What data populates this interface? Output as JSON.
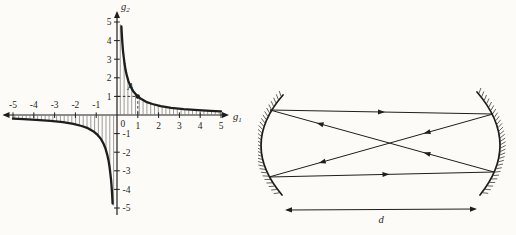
{
  "figure": {
    "background": "#fcfbf8",
    "ink": "#1e1e1e"
  },
  "chart": {
    "origin_label": "0",
    "x_axis_label": {
      "base": "g",
      "sub": "1"
    },
    "y_axis_label": {
      "base": "g",
      "sub": "2"
    }
  },
  "chart_data": {
    "type": "line",
    "title": "",
    "xlabel": "g1",
    "ylabel": "g2",
    "xlim": [
      -5.5,
      5.4
    ],
    "ylim": [
      -5.4,
      5.55
    ],
    "grid": false,
    "legend": false,
    "x_ticks": [
      -5,
      -4,
      -3,
      -2,
      -1,
      1,
      2,
      3,
      4,
      5
    ],
    "y_ticks": [
      5,
      4,
      3,
      2,
      1,
      -1,
      -2,
      -3,
      -4,
      -5
    ],
    "series": [
      {
        "name": "g2 = 1/g1 (g1 > 0)",
        "x": [
          0.21,
          0.22,
          0.24,
          0.26,
          0.29,
          0.32,
          0.36,
          0.41,
          0.47,
          0.55,
          0.65,
          0.78,
          0.95,
          1.15,
          1.4,
          1.7,
          2.1,
          2.6,
          3.2,
          3.9,
          4.5,
          5.0
        ],
        "y": [
          4.76,
          4.55,
          4.17,
          3.85,
          3.45,
          3.13,
          2.78,
          2.44,
          2.13,
          1.82,
          1.54,
          1.28,
          1.05,
          0.87,
          0.71,
          0.59,
          0.48,
          0.38,
          0.31,
          0.26,
          0.22,
          0.2
        ]
      },
      {
        "name": "g2 = 1/g1 (g1 < 0)",
        "x": [
          -5.0,
          -4.5,
          -3.9,
          -3.2,
          -2.6,
          -2.1,
          -1.7,
          -1.4,
          -1.15,
          -0.95,
          -0.78,
          -0.65,
          -0.55,
          -0.47,
          -0.41,
          -0.36,
          -0.32,
          -0.29,
          -0.26,
          -0.24,
          -0.22,
          -0.21
        ],
        "y": [
          -0.2,
          -0.22,
          -0.26,
          -0.31,
          -0.38,
          -0.48,
          -0.59,
          -0.71,
          -0.87,
          -1.05,
          -1.28,
          -1.54,
          -1.82,
          -2.13,
          -2.44,
          -2.78,
          -3.13,
          -3.45,
          -3.85,
          -4.17,
          -4.55,
          -4.76
        ]
      }
    ],
    "point": {
      "label": "A",
      "x": 1,
      "y": 1,
      "dashed_guides": true
    },
    "hatched_stable_region": true
  },
  "resonator": {
    "distance_label": "d"
  }
}
